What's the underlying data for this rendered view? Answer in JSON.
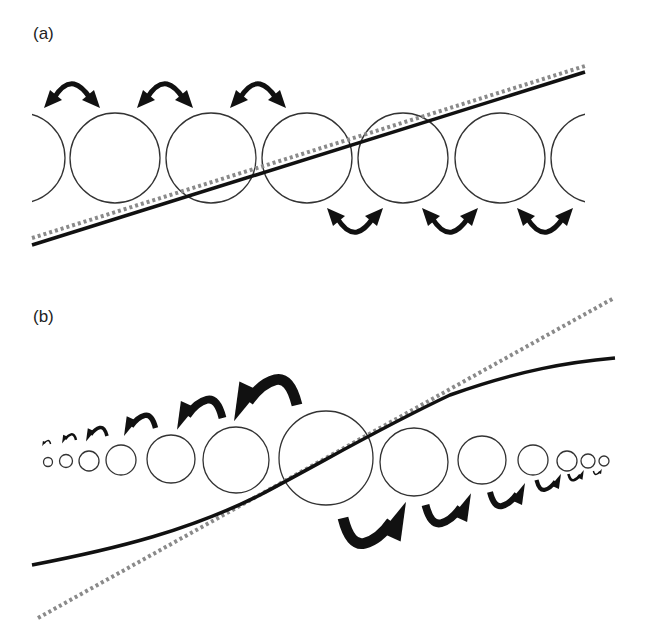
{
  "panels": [
    {
      "label": "(a)",
      "description": "Equal-sized circles along a straight regression line; dotted reference line nearly coincides",
      "circles": [
        {
          "cx": 20,
          "cy": 158,
          "r": 45
        },
        {
          "cx": 115,
          "cy": 158,
          "r": 45
        },
        {
          "cx": 211,
          "cy": 158,
          "r": 45
        },
        {
          "cx": 307,
          "cy": 158,
          "r": 45
        },
        {
          "cx": 403,
          "cy": 158,
          "r": 45
        },
        {
          "cx": 500,
          "cy": 158,
          "r": 45
        },
        {
          "cx": 596,
          "cy": 158,
          "r": 45
        }
      ],
      "solid_line": {
        "x1": 32,
        "y1": 245,
        "x2": 585,
        "y2": 72
      },
      "dotted_line": {
        "x1": 32,
        "y1": 238,
        "x2": 585,
        "y2": 66
      },
      "arrows_top": [
        {
          "x": 72,
          "y": 100
        },
        {
          "x": 165,
          "y": 100
        },
        {
          "x": 258,
          "y": 100
        }
      ],
      "arrows_bottom": [
        {
          "x": 355,
          "y": 216
        },
        {
          "x": 450,
          "y": 216
        },
        {
          "x": 545,
          "y": 216
        }
      ]
    },
    {
      "label": "(b)",
      "description": "Circles decreasing in size away from center; solid sigmoid-shaped line versus dotted straight line",
      "circles": [
        {
          "cx": 48,
          "cy": 462,
          "r": 4.5
        },
        {
          "cx": 66,
          "cy": 461,
          "r": 6.5
        },
        {
          "cx": 89,
          "cy": 461,
          "r": 10
        },
        {
          "cx": 121,
          "cy": 460,
          "r": 15
        },
        {
          "cx": 171,
          "cy": 459,
          "r": 24
        },
        {
          "cx": 236,
          "cy": 460,
          "r": 33
        },
        {
          "cx": 326,
          "cy": 458,
          "r": 47
        },
        {
          "cx": 414,
          "cy": 462,
          "r": 34
        },
        {
          "cx": 482,
          "cy": 460,
          "r": 24
        },
        {
          "cx": 533,
          "cy": 460,
          "r": 15
        },
        {
          "cx": 567,
          "cy": 461,
          "r": 10
        },
        {
          "cx": 588,
          "cy": 461,
          "r": 7
        },
        {
          "cx": 604,
          "cy": 461,
          "r": 5
        }
      ],
      "solid_curve": "M32,565 C120,548 190,530 260,495 C330,458 380,428 450,395 C520,370 570,362 615,358",
      "dotted_line": {
        "x1": 38,
        "y1": 618,
        "x2": 614,
        "y2": 298
      },
      "arrows_left": [
        {
          "x": 47,
          "y": 444,
          "scale": 0.12
        },
        {
          "x": 70,
          "y": 440,
          "scale": 0.2
        },
        {
          "x": 98,
          "y": 436,
          "scale": 0.3
        },
        {
          "x": 142,
          "y": 428,
          "scale": 0.45
        },
        {
          "x": 203,
          "y": 418,
          "scale": 0.65
        },
        {
          "x": 270,
          "y": 405,
          "scale": 0.9
        }
      ],
      "arrows_right": [
        {
          "x": 370,
          "y": 518,
          "scale": 0.9
        },
        {
          "x": 445,
          "y": 505,
          "scale": 0.65
        },
        {
          "x": 505,
          "y": 492,
          "scale": 0.5
        },
        {
          "x": 547,
          "y": 480,
          "scale": 0.35
        },
        {
          "x": 575,
          "y": 474,
          "scale": 0.22
        },
        {
          "x": 597,
          "y": 471,
          "scale": 0.12
        }
      ]
    }
  ],
  "colors": {
    "circle_stroke": "#333333",
    "solid_line": "#111111",
    "dotted_line": "#8a8a8a",
    "arrow": "#111111",
    "background": "#ffffff"
  }
}
